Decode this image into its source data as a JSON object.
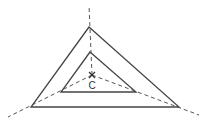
{
  "diagram": {
    "type": "nested-triangles-with-center",
    "center": {
      "label": "C",
      "x": 92,
      "y": 75
    },
    "outer_triangle": {
      "points": [
        [
          89,
          27
        ],
        [
          31,
          107
        ],
        [
          179,
          107
        ]
      ]
    },
    "inner_triangle": {
      "points": [
        [
          90,
          52
        ],
        [
          61,
          92
        ],
        [
          136,
          92
        ]
      ]
    },
    "rays": [
      {
        "from": [
          92,
          75
        ],
        "to": [
          89,
          5
        ]
      },
      {
        "from": [
          92,
          75
        ],
        "to": [
          8,
          117
        ]
      },
      {
        "from": [
          92,
          75
        ],
        "to": [
          199,
          115
        ]
      }
    ],
    "colors": {
      "stroke": "#444444",
      "dash": "#555555",
      "background": "#ffffff"
    }
  }
}
